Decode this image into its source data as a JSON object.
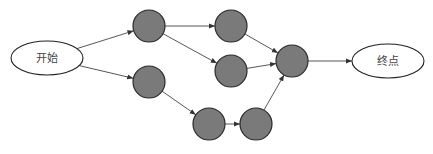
{
  "diagram": {
    "type": "flow-network",
    "start": {
      "id": "start",
      "label": "开始",
      "cx": 47,
      "cy": 58,
      "rx": 36,
      "ry": 17
    },
    "end": {
      "id": "end",
      "label": "终点",
      "cx": 388,
      "cy": 61,
      "rx": 36,
      "ry": 17
    },
    "nodes": [
      {
        "id": "A",
        "cx": 149,
        "cy": 26,
        "r": 16
      },
      {
        "id": "B",
        "cx": 231,
        "cy": 26,
        "r": 16
      },
      {
        "id": "C",
        "cx": 231,
        "cy": 71,
        "r": 16
      },
      {
        "id": "D",
        "cx": 149,
        "cy": 82,
        "r": 16
      },
      {
        "id": "E",
        "cx": 209,
        "cy": 124,
        "r": 16
      },
      {
        "id": "F",
        "cx": 256,
        "cy": 124,
        "r": 16
      },
      {
        "id": "G",
        "cx": 292,
        "cy": 61,
        "r": 16
      }
    ],
    "edges": [
      {
        "from": "start",
        "to": "A"
      },
      {
        "from": "start",
        "to": "D"
      },
      {
        "from": "A",
        "to": "B"
      },
      {
        "from": "A",
        "to": "C"
      },
      {
        "from": "B",
        "to": "G"
      },
      {
        "from": "C",
        "to": "G"
      },
      {
        "from": "D",
        "to": "E"
      },
      {
        "from": "E",
        "to": "F"
      },
      {
        "from": "F",
        "to": "G"
      },
      {
        "from": "G",
        "to": "end"
      }
    ],
    "colors": {
      "node_fill": "#7a7a7a",
      "node_stroke": "#2a2a2a",
      "edge": "#444444",
      "terminal_fill": "#ffffff"
    }
  }
}
